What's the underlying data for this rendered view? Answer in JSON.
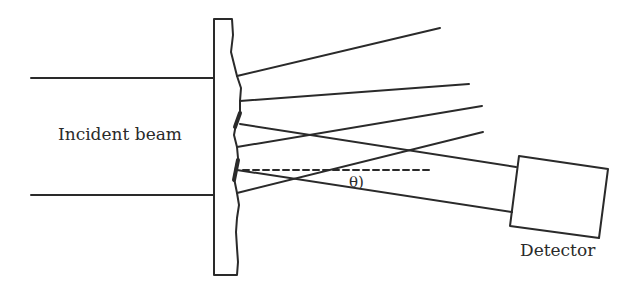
{
  "diagram": {
    "type": "x-ray diffraction schematic",
    "labels": {
      "incident_beam": "Incident beam",
      "detector": "Detector",
      "angle": "θ)"
    },
    "colors": {
      "stroke": "#2a2a2a",
      "background": "#ffffff"
    },
    "elements": [
      "incident-beam-lines",
      "sample-plate",
      "diffracted-rays",
      "reference-dashed-line",
      "angle-theta",
      "detector-box"
    ]
  }
}
